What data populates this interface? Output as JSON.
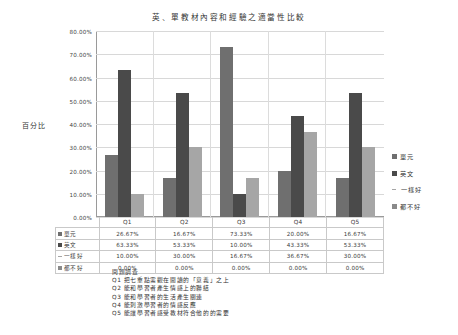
{
  "chart_data": {
    "type": "bar",
    "title": "英、單教材內容和經驗之適當性比較",
    "xlabel": "",
    "ylabel": "百分比",
    "ylim": [
      0,
      80
    ],
    "ytick_labels": [
      "0.00%",
      "10.00%",
      "20.00%",
      "30.00%",
      "40.00%",
      "50.00%",
      "60.00%",
      "70.00%",
      "80.00%"
    ],
    "ytick_values": [
      0,
      10,
      20,
      30,
      40,
      50,
      60,
      70,
      80
    ],
    "grid": true,
    "legend_position": "right",
    "categories": [
      "Q1",
      "Q2",
      "Q3",
      "Q4",
      "Q5"
    ],
    "series": [
      {
        "name": "單元",
        "color": "#6f6f6f",
        "marker": "square",
        "values": [
          26.67,
          16.67,
          73.33,
          20.0,
          16.67
        ],
        "labels": [
          "26.67%",
          "16.67%",
          "73.33%",
          "20.00%",
          "16.67%"
        ]
      },
      {
        "name": "英文",
        "color": "#4a4a4a",
        "marker": "square",
        "values": [
          63.33,
          53.33,
          10.0,
          43.33,
          53.33
        ],
        "labels": [
          "63.33%",
          "53.33%",
          "10.00%",
          "43.33%",
          "53.33%"
        ]
      },
      {
        "name": "一樣好",
        "color": "#a6a6a6",
        "marker": "line",
        "values": [
          10.0,
          30.0,
          16.67,
          36.67,
          30.0
        ],
        "labels": [
          "10.00%",
          "30.00%",
          "16.67%",
          "36.67%",
          "30.00%"
        ]
      },
      {
        "name": "都不好",
        "color": "#8a8a8a",
        "marker": "square",
        "values": [
          0.0,
          0.0,
          0.0,
          0.0,
          0.0
        ],
        "labels": [
          "0.00%",
          "0.00%",
          "0.00%",
          "0.00%",
          "0.00%"
        ]
      }
    ]
  },
  "footnote": {
    "heading": "問題調查",
    "lines": [
      "Q1 把七重點需觀在閱讀的「意義」之上",
      "Q2 能和學習者產生情感上的聯結",
      "Q3 能和學習者的生活產生關連",
      "Q4 能刺激學習者的情感反應",
      "Q5 能讓學習者感受教材符合他的的需要"
    ]
  }
}
